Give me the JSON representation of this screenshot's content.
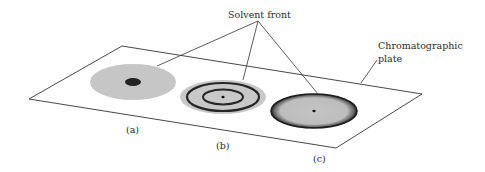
{
  "diagram": {
    "labels": {
      "solvent_front": "Solvent front",
      "plate_line1": "Chromatographic",
      "plate_line2": "plate",
      "a": "(a)",
      "b": "(b)",
      "c": "(c)"
    },
    "colors": {
      "spot_fill": "#c4c4c4",
      "ring": "#262626",
      "line": "#333333",
      "background": "#ffffff"
    }
  }
}
